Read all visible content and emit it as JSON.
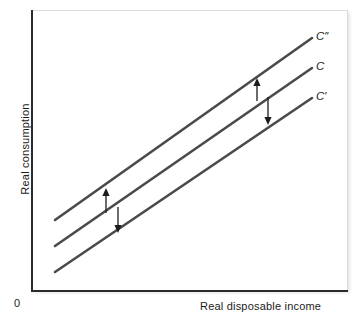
{
  "chart_data": {
    "type": "line",
    "title": "",
    "subtitle": "",
    "xlabel": "Real disposable income",
    "ylabel": "Real consumption",
    "origin_label": "0",
    "grid": false,
    "legend": "inline-end-labels",
    "xlim": [
      0,
      100
    ],
    "ylim": [
      0,
      100
    ],
    "axis_ticks": {
      "x": [],
      "y": []
    },
    "line_color": "#4a4a4a",
    "axis_color": "#2b2b2b",
    "series": [
      {
        "name": "C″",
        "label": "C″",
        "description": "upward-shifted consumption function",
        "points": [
          [
            8,
            25
          ],
          [
            110,
            90
          ]
        ],
        "pixel_start": [
          55,
          220
        ],
        "pixel_end": [
          312,
          38
        ]
      },
      {
        "name": "C",
        "label": "C",
        "description": "baseline consumption function",
        "points": [
          [
            8,
            16
          ],
          [
            110,
            79
          ]
        ],
        "pixel_start": [
          55,
          246
        ],
        "pixel_end": [
          312,
          68
        ]
      },
      {
        "name": "C′",
        "label": "C′",
        "description": "downward-shifted consumption function",
        "points": [
          [
            8,
            6
          ],
          [
            110,
            69
          ]
        ],
        "pixel_start": [
          55,
          272
        ],
        "pixel_end": [
          312,
          98
        ]
      }
    ],
    "annotations": [
      {
        "name": "shift-up-arrow-left",
        "symbol": "↑",
        "direction": "up",
        "meaning": "upward shift from C to C″",
        "pixel_from": [
          106,
          213
        ],
        "pixel_to": [
          106,
          188
        ]
      },
      {
        "name": "shift-down-arrow-left",
        "symbol": "↓",
        "direction": "down",
        "meaning": "downward shift from C to C′",
        "pixel_from": [
          118,
          207
        ],
        "pixel_to": [
          118,
          233
        ]
      },
      {
        "name": "shift-up-arrow-right",
        "symbol": "↑",
        "direction": "up",
        "meaning": "upward shift from C to C″",
        "pixel_from": [
          257,
          101
        ],
        "pixel_to": [
          257,
          78
        ]
      },
      {
        "name": "shift-down-arrow-right",
        "symbol": "↓",
        "direction": "down",
        "meaning": "downward shift from C to C′",
        "pixel_from": [
          268,
          97
        ]
      }
    ]
  },
  "labels": {
    "ylabel": "Real consumption",
    "xlabel": "Real disposable income",
    "origin": "0",
    "curve_upper": "C″",
    "curve_middle": "C",
    "curve_lower": "C′"
  },
  "colors": {
    "line": "#4a4a4a",
    "axis": "#2b2b2b",
    "arrow": "#1c1c1c",
    "frame_border": "#dcdcdc",
    "background": "#ffffff"
  }
}
